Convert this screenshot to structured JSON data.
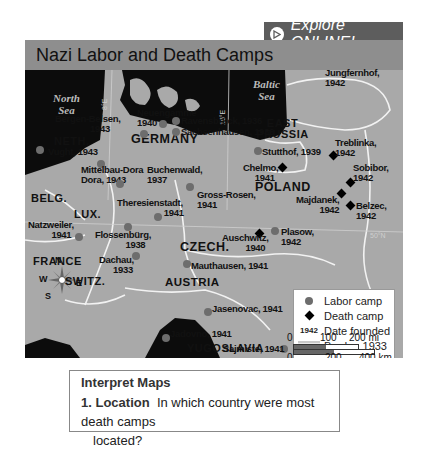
{
  "explore": {
    "label": "Explore ONLINE!",
    "icon": "play-circle-icon"
  },
  "map": {
    "title": "Nazi Labor and Death Camps",
    "seas": [
      {
        "name": "North Sea",
        "line1": "North",
        "line2": "Sea"
      },
      {
        "name": "Baltic Sea",
        "line1": "Baltic",
        "line2": "Sea"
      },
      {
        "name": "Adriatic Sea",
        "line1": "Adriatic"
      }
    ],
    "meridians": [
      "8°E",
      "16°E"
    ],
    "parallel": "50°N",
    "countries": [
      "GERMANY",
      "POLAND",
      "CZECH.",
      "AUSTRIA",
      "FRANCE",
      "SWITZ.",
      "BELG.",
      "LUX.",
      "NETH.",
      "EAST PRUSSIA",
      "YUGOSLAVIA"
    ],
    "labor_camps": [
      {
        "name": "Bergen-Belsen",
        "year": "1943"
      },
      {
        "name": "Neuengamme",
        "year": "1940"
      },
      {
        "name": "Ravensbrück",
        "year": "1936"
      },
      {
        "name": "Sachsenhausen",
        "year": "1936"
      },
      {
        "name": "Vught",
        "year": "1943"
      },
      {
        "name": "Mittelbau-Dora",
        "year": "1943"
      },
      {
        "name": "Buchenwald",
        "year": "1937"
      },
      {
        "name": "Gross-Rosen",
        "year": "1941"
      },
      {
        "name": "Theresienstadt",
        "year": "1941"
      },
      {
        "name": "Natzweiler",
        "year": "1941"
      },
      {
        "name": "Flossenbürg",
        "year": "1938"
      },
      {
        "name": "Dachau",
        "year": "1933"
      },
      {
        "name": "Mauthausen",
        "year": "1941"
      },
      {
        "name": "Plasow",
        "year": "1942"
      },
      {
        "name": "Stutthof",
        "year": "1939"
      },
      {
        "name": "Jungfernhof",
        "year": "1942"
      },
      {
        "name": "Jasenovac",
        "year": "1941"
      },
      {
        "name": "Jadovno",
        "year": "1941"
      },
      {
        "name": "Sajmiste",
        "year": "1941"
      }
    ],
    "death_camps": [
      {
        "name": "Treblinka",
        "year": "1942"
      },
      {
        "name": "Chelmo",
        "year": "1941"
      },
      {
        "name": "Sobibor",
        "year": "1942"
      },
      {
        "name": "Majdanek",
        "year": "1942"
      },
      {
        "name": "Belzec",
        "year": "1942"
      },
      {
        "name": "Auschwitz",
        "year": "1940"
      }
    ],
    "compass": {
      "n": "N",
      "s": "S",
      "e": "E",
      "w": "W"
    },
    "legend": {
      "labor": "Labor camp",
      "death": "Death camp",
      "date_sample": "1942",
      "date": "Date founded",
      "border": "Border, 1933"
    },
    "scale": {
      "mi": [
        "0",
        "100",
        "200 mi"
      ],
      "km": [
        "0",
        "200",
        "400 km"
      ]
    }
  },
  "question": {
    "heading": "Interpret Maps",
    "number": "1.",
    "topic": "Location",
    "text_line1": "In which country were most death camps",
    "text_line2": "located?"
  }
}
